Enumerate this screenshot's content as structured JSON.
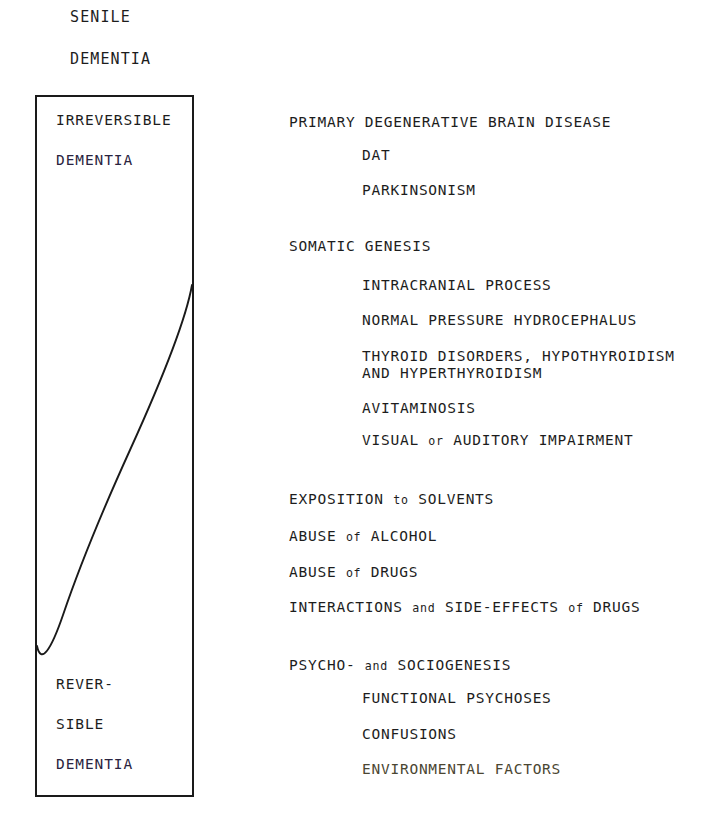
{
  "figure": {
    "title_lines": [
      "SENILE",
      "DEMENTIA"
    ],
    "spectrum_box": {
      "top_label_lines": [
        "IRREVERSIBLE",
        "DEMENTIA"
      ],
      "bottom_label_lines": [
        "REVER-",
        "SIBLE",
        "DEMENTIA"
      ],
      "divider": "s-curve separating irreversible (upper-left) from reversible (lower-right) dementia"
    },
    "causes": [
      {
        "level": 0,
        "text": "PRIMARY DEGENERATIVE BRAIN DISEASE",
        "y": 114
      },
      {
        "level": 1,
        "text": "DAT",
        "y": 147
      },
      {
        "level": 1,
        "text": "PARKINSONISM",
        "y": 182
      },
      {
        "level": 0,
        "text": "SOMATIC GENESIS",
        "y": 238
      },
      {
        "level": 1,
        "text": "INTRACRANIAL PROCESS",
        "y": 277
      },
      {
        "level": 1,
        "text": "NORMAL PRESSURE HYDROCEPHALUS",
        "y": 312
      },
      {
        "level": 1,
        "text": "THYROID DISORDERS, HYPOTHYROIDISM",
        "cont": "AND HYPERTHYROIDISM",
        "y": 348
      },
      {
        "level": 1,
        "text": "AVITAMINOSIS",
        "y": 400
      },
      {
        "level": 1,
        "y": 432,
        "parts": [
          {
            "t": "VISUAL "
          },
          {
            "t": "or",
            "sc": true
          },
          {
            "t": " AUDITORY IMPAIRMENT"
          }
        ]
      },
      {
        "level": 0,
        "y": 491,
        "parts": [
          {
            "t": "EXPOSITION "
          },
          {
            "t": "to",
            "sc": true
          },
          {
            "t": " SOLVENTS"
          }
        ]
      },
      {
        "level": 0,
        "y": 528,
        "parts": [
          {
            "t": "ABUSE "
          },
          {
            "t": "of",
            "sc": true
          },
          {
            "t": " ALCOHOL"
          }
        ]
      },
      {
        "level": 0,
        "y": 564,
        "parts": [
          {
            "t": "ABUSE "
          },
          {
            "t": "of",
            "sc": true
          },
          {
            "t": " DRUGS"
          }
        ]
      },
      {
        "level": 0,
        "y": 599,
        "parts": [
          {
            "t": "INTERACTIONS "
          },
          {
            "t": "and",
            "sc": true
          },
          {
            "t": " SIDE-EFFECTS "
          },
          {
            "t": "of",
            "sc": true
          },
          {
            "t": " DRUGS"
          }
        ]
      },
      {
        "level": 0,
        "y": 657,
        "parts": [
          {
            "t": "PSYCHO- "
          },
          {
            "t": "and",
            "sc": true
          },
          {
            "t": " SOCIOGENESIS"
          }
        ]
      },
      {
        "level": 1,
        "text": "FUNCTIONAL PSYCHOSES",
        "y": 690
      },
      {
        "level": 1,
        "text": "CONFUSIONS",
        "y": 726
      },
      {
        "level": 1,
        "text": "ENVIRONMENTAL FACTORS",
        "y": 761,
        "degraded": true
      }
    ]
  },
  "colors": {
    "ink": "#1d1d1d",
    "rule": "#1a1a1a",
    "paper": "#ffffff"
  }
}
